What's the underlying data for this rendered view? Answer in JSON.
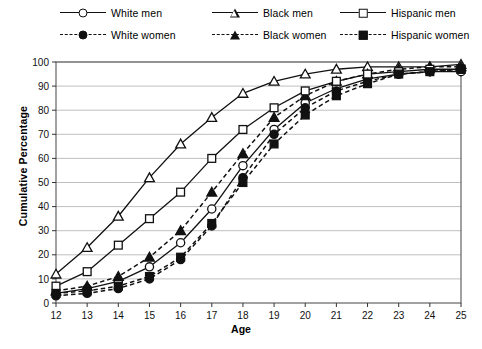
{
  "legend": {
    "items": [
      {
        "label": "White men",
        "marker": "circle-open",
        "line": "solid",
        "col": 0,
        "row": 0
      },
      {
        "label": "White women",
        "marker": "circle-fill",
        "line": "dashed",
        "col": 0,
        "row": 1
      },
      {
        "label": "Black men",
        "marker": "triangle-open",
        "line": "solid",
        "col": 1,
        "row": 0
      },
      {
        "label": "Black women",
        "marker": "triangle-fill",
        "line": "dashed",
        "col": 1,
        "row": 1
      },
      {
        "label": "Hispanic men",
        "marker": "square-open",
        "line": "solid",
        "col": 2,
        "row": 0
      },
      {
        "label": "Hispanic women",
        "marker": "square-fill",
        "line": "dashed",
        "col": 2,
        "row": 1
      }
    ]
  },
  "chart_data": {
    "type": "line",
    "title": "",
    "xlabel": "Age",
    "ylabel": "Cumulative Percentage",
    "x": [
      12,
      13,
      14,
      15,
      16,
      17,
      18,
      19,
      20,
      21,
      22,
      23,
      24,
      25
    ],
    "xlim": [
      12,
      25
    ],
    "ylim": [
      0,
      100
    ],
    "yticks": [
      0,
      10,
      20,
      30,
      40,
      50,
      60,
      70,
      80,
      90,
      100
    ],
    "xticks": [
      12,
      13,
      14,
      15,
      16,
      17,
      18,
      19,
      20,
      21,
      22,
      23,
      24,
      25
    ],
    "grid": "horizontal",
    "legend_position": "top",
    "series": [
      {
        "name": "White men",
        "marker": "circle-open",
        "line": "solid",
        "values": [
          4,
          6,
          9,
          15,
          25,
          39,
          57,
          72,
          83,
          89,
          93,
          95,
          96,
          96
        ]
      },
      {
        "name": "White women",
        "marker": "circle-fill",
        "line": "dashed",
        "values": [
          3,
          4,
          6,
          10,
          18,
          32,
          52,
          70,
          81,
          88,
          92,
          95,
          96,
          97
        ]
      },
      {
        "name": "Black men",
        "marker": "triangle-open",
        "line": "solid",
        "values": [
          12,
          23,
          36,
          52,
          66,
          77,
          87,
          92,
          95,
          97,
          98,
          98,
          98,
          99
        ]
      },
      {
        "name": "Black women",
        "marker": "triangle-fill",
        "line": "dashed",
        "values": [
          5,
          7,
          11,
          19,
          30,
          46,
          62,
          77,
          86,
          92,
          95,
          97,
          98,
          98
        ]
      },
      {
        "name": "Hispanic men",
        "marker": "square-open",
        "line": "solid",
        "values": [
          7,
          13,
          24,
          35,
          46,
          60,
          72,
          81,
          88,
          92,
          95,
          96,
          97,
          97
        ]
      },
      {
        "name": "Hispanic women",
        "marker": "square-fill",
        "line": "dashed",
        "values": [
          4,
          5,
          7,
          11,
          19,
          33,
          50,
          66,
          78,
          86,
          91,
          95,
          96,
          97
        ]
      }
    ]
  }
}
